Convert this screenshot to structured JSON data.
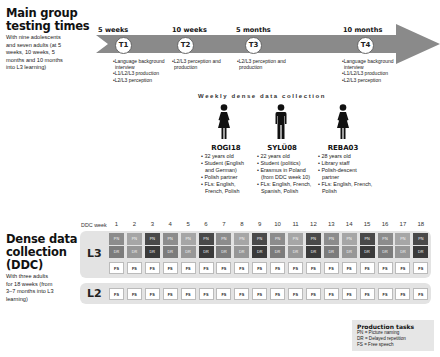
{
  "main_group": {
    "title_line1": "Main group",
    "title_line2": "testing times",
    "description": [
      "With nine adolescents",
      "and seven adults (at 5",
      "weeks, 10 weeks, 5",
      "months and 10 months",
      "into L3 learning)"
    ]
  },
  "timeline": {
    "arrow_color": "#8a8a8a",
    "points": [
      {
        "label": "5 weeks",
        "id": "T1",
        "notes": [
          "•Language background",
          " interview",
          "•L1/L2/L3 production",
          "•L2/L3 perception"
        ]
      },
      {
        "label": "10 weeks",
        "id": "T2",
        "notes": [
          "•L2/L3 perception and",
          " production"
        ]
      },
      {
        "label": "5 months",
        "id": "T3",
        "notes": [
          "•L2/L3 perception and",
          " production"
        ]
      },
      {
        "label": "10 months",
        "id": "T4",
        "notes": [
          "•Language background",
          " interview",
          "•L1/L2/L3 production",
          "•L2/L3 perception"
        ]
      }
    ]
  },
  "weekly_collection": {
    "title": "Weekly dense data collection",
    "participants": [
      {
        "name": "ROGI18",
        "figure": "female",
        "info": [
          "• 32 years old",
          "• Student (English",
          "  and German)",
          "• Polish partner",
          "• FLs: English,",
          "  French, Polish"
        ]
      },
      {
        "name": "SYLÜ08",
        "figure": "male",
        "info": [
          "• 22 years old",
          "• Student (politics)",
          "• Erasmus in Poland",
          "  (from DDC week 10)",
          "• FLs: English, French,",
          "  Spanish, Polish"
        ]
      },
      {
        "name": "REBA03",
        "figure": "female",
        "info": [
          "• 28 years old",
          "• Library staff",
          "• Polish-descent",
          "  partner",
          "• FLs: English, French,",
          "  Polish"
        ]
      }
    ]
  },
  "ddc": {
    "title_line1": "Dense data",
    "title_line2": "collection",
    "title_line3": "(DDC)",
    "description": [
      "With three adults",
      "for 18 weeks (from",
      "3–7 months into L3",
      "learning)"
    ],
    "week_label": "DDC week",
    "weeks": [
      "1",
      "2",
      "3",
      "4",
      "5",
      "6",
      "7",
      "8",
      "9",
      "10",
      "11",
      "12",
      "13",
      "14",
      "15",
      "16",
      "17",
      "18"
    ],
    "rows": [
      {
        "lang": "L3",
        "tasks": [
          "PN",
          "DR",
          "FS"
        ]
      },
      {
        "lang": "L2",
        "tasks": [
          "FS"
        ]
      }
    ],
    "shade_pattern": [
      "a",
      "b",
      "c"
    ]
  },
  "legend": {
    "title": "Production tasks",
    "items": [
      "PN = Picture naming",
      "DR = Delayed repetition",
      "FS = Free speech"
    ]
  }
}
